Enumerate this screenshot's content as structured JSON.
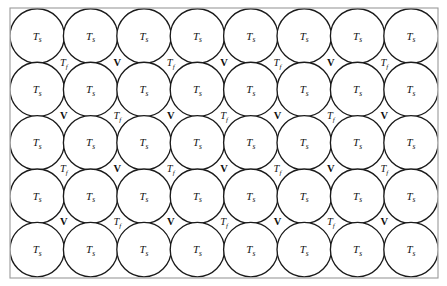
{
  "diagram": {
    "frame": {
      "x": 10,
      "y": 8,
      "width": 428,
      "height": 270,
      "stroke_color": "#9a9a9a"
    },
    "background_color": "#ffffff",
    "circle": {
      "radius": 27.2,
      "stroke_color": "#1b1b1b",
      "fill_color": "#ffffff",
      "columns": 8,
      "rows": 5,
      "x_start": 37.2,
      "x_step": 53.4,
      "y_start": 36.0,
      "y_step": 53.4
    },
    "labels": {
      "solid_symbol": "T",
      "solid_subscript": "s",
      "fluid_symbol": "T",
      "fluid_subscript": "f",
      "volume_symbol": "V"
    },
    "interstitial": {
      "x_start": 63.9,
      "x_step": 53.4,
      "count_per_row": 7,
      "rows": [
        {
          "y": 66,
          "pattern": [
            "Tf",
            "V",
            "Tf",
            "V",
            "Tf",
            "V",
            "Tf"
          ]
        },
        {
          "y": 119,
          "pattern": [
            "V",
            "Tf",
            "V",
            "Tf",
            "V",
            "Tf",
            "V"
          ]
        },
        {
          "y": 172,
          "pattern": [
            "Tf",
            "V",
            "Tf",
            "V",
            "Tf",
            "V",
            "Tf"
          ]
        },
        {
          "y": 225,
          "pattern": [
            "V",
            "Tf",
            "V",
            "Tf",
            "V",
            "Tf",
            "V"
          ]
        }
      ]
    }
  }
}
